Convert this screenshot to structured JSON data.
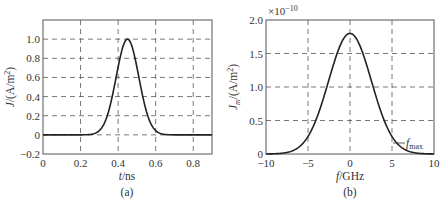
{
  "chart_data": [
    {
      "type": "line",
      "panel_label": "(a)",
      "title": "",
      "xlabel": "t/ns",
      "ylabel": "J/(A/m²)",
      "xlim": [
        0,
        0.9
      ],
      "ylim": [
        -0.2,
        1.2
      ],
      "xticks": [
        "0",
        "0.2",
        "0.4",
        "0.6",
        "0.8"
      ],
      "yticks": [
        "−0.2",
        "0",
        "0.2",
        "0.4",
        "0.6",
        "0.8",
        "1.0"
      ],
      "grid": "dashed",
      "series": [
        {
          "name": "J(t)",
          "description": "Gaussian pulse, peak 1.0 at t≈0.45 ns, zero outside ~0.22–0.68 ns",
          "x": [
            0,
            0.2,
            0.25,
            0.3,
            0.35,
            0.4,
            0.45,
            0.5,
            0.55,
            0.6,
            0.65,
            0.7,
            0.9
          ],
          "y": [
            0,
            0,
            0.02,
            0.14,
            0.42,
            0.8,
            1.0,
            0.8,
            0.42,
            0.14,
            0.02,
            0,
            0
          ]
        }
      ]
    },
    {
      "type": "line",
      "panel_label": "(b)",
      "title": "",
      "xlabel": "f/GHz",
      "ylabel": "Jm/(A/m²)",
      "y_multiplier": "×10⁻¹⁰",
      "xlim": [
        -10,
        10
      ],
      "ylim": [
        0,
        2.0
      ],
      "xticks": [
        "−10",
        "−5",
        "0",
        "5",
        "10"
      ],
      "yticks": [
        "0",
        "0.5",
        "1.0",
        "1.5",
        "2.0"
      ],
      "grid": "dashed",
      "annotations": [
        {
          "text": "fmax",
          "x": 5,
          "y": 0.2
        }
      ],
      "series": [
        {
          "name": "Jm(f)",
          "description": "Gaussian spectrum, peak ≈1.8e-10 at f=0",
          "x": [
            -10,
            -8,
            -7,
            -6,
            -5,
            -4,
            -3,
            -2,
            -1,
            0,
            1,
            2,
            3,
            4,
            5,
            6,
            7,
            8,
            10
          ],
          "y": [
            0,
            0,
            0.02,
            0.1,
            0.25,
            0.5,
            0.85,
            1.25,
            1.62,
            1.8,
            1.62,
            1.25,
            0.85,
            0.5,
            0.25,
            0.1,
            0.02,
            0,
            0
          ]
        }
      ]
    }
  ],
  "panels": {
    "a": {
      "label": "(a)",
      "xlabel_var": "t",
      "xlabel_unit": "/ns",
      "ylabel": "J/(A/m²)"
    },
    "b": {
      "label": "(b)",
      "xlabel_var": "f",
      "xlabel_unit": "/GHz",
      "ylabel": "Jm/(A/m²)",
      "multiplier": "×10⁻¹⁰",
      "annotation": "fmax"
    }
  }
}
